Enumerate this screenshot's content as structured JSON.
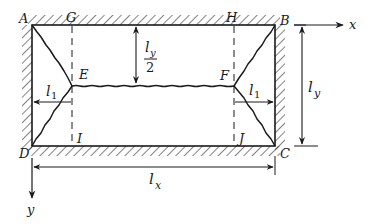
{
  "figure": {
    "type": "yield-line pattern of rectangular slab, all edges fixed",
    "colors": {
      "ink": "#1a1a1a",
      "background": "#ffffff"
    }
  },
  "points": {
    "A": {
      "label": "A",
      "x": 32,
      "y": 25
    },
    "B": {
      "label": "B",
      "x": 275,
      "y": 25
    },
    "C": {
      "label": "C",
      "x": 275,
      "y": 146
    },
    "D": {
      "label": "D",
      "x": 32,
      "y": 146
    },
    "E": {
      "label": "E",
      "x": 72,
      "y": 86
    },
    "F": {
      "label": "F",
      "x": 234,
      "y": 86
    },
    "G": {
      "label": "G",
      "x": 72,
      "y": 25
    },
    "H": {
      "label": "H",
      "x": 234,
      "y": 25
    },
    "I": {
      "label": "I",
      "x": 72,
      "y": 146
    },
    "J": {
      "label": "J",
      "x": 234,
      "y": 146
    }
  },
  "axes": {
    "x": {
      "label": "x"
    },
    "y": {
      "label": "y"
    }
  },
  "dimensions": {
    "ly_half": {
      "num": "l",
      "num_sub": "y",
      "den": "2"
    },
    "ly": {
      "main": "l",
      "sub": "y"
    },
    "lx": {
      "main": "l",
      "sub": "x"
    },
    "l1_left": {
      "main": "l",
      "sub": "1"
    },
    "l1_right": {
      "main": "l",
      "sub": "1"
    }
  }
}
